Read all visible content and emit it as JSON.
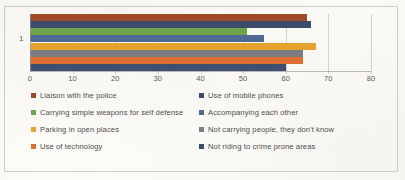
{
  "chart_data": {
    "type": "bar",
    "orientation": "horizontal",
    "title": "",
    "xlabel": "",
    "ylabel": "",
    "categories": [
      "1"
    ],
    "xlim": [
      0,
      80
    ],
    "xticks": [
      0,
      10,
      20,
      30,
      40,
      50,
      60,
      70,
      80
    ],
    "grid": true,
    "legend_position": "bottom",
    "series": [
      {
        "name": "Liaison with the police",
        "values": [
          65
        ],
        "color": "#9C4A28"
      },
      {
        "name": "Use of mobile phones",
        "values": [
          66
        ],
        "color": "#3C4B6B"
      },
      {
        "name": "Carrying simple weapons for self defense",
        "values": [
          51
        ],
        "color": "#6FA34A"
      },
      {
        "name": "Accompanying each other",
        "values": [
          55
        ],
        "color": "#4E6A92"
      },
      {
        "name": "Parking in open places",
        "values": [
          67
        ],
        "color": "#E5A22F"
      },
      {
        "name": "Not carrying people, they don't know",
        "values": [
          64
        ],
        "color": "#7A7D83"
      },
      {
        "name": "Use of technology",
        "values": [
          64
        ],
        "color": "#DE6F34"
      },
      {
        "name": "Not riding to  crime prone areas",
        "values": [
          60
        ],
        "color": "#3F4E73"
      }
    ]
  },
  "axis": {
    "tick_labels": [
      "0",
      "10",
      "20",
      "30",
      "40",
      "50",
      "60",
      "70",
      "80"
    ],
    "category_label": "1"
  },
  "legend": {
    "items": [
      {
        "label": "Liaison with the police",
        "color": "#9C4A28",
        "swatch": "legend-swatch"
      },
      {
        "label": "Use of mobile phones",
        "color": "#3C4B6B",
        "swatch": "legend-swatch"
      },
      {
        "label": "Carrying simple weapons for self defense",
        "color": "#6FA34A",
        "swatch": "legend-swatch"
      },
      {
        "label": "Accompanying each other",
        "color": "#4E6A92",
        "swatch": "legend-swatch"
      },
      {
        "label": "Parking in open places",
        "color": "#E5A22F",
        "swatch": "legend-swatch"
      },
      {
        "label": "Not carrying people, they don't know",
        "color": "#7A7D83",
        "swatch": "legend-swatch"
      },
      {
        "label": "Use of technology",
        "color": "#DE6F34",
        "swatch": "legend-swatch"
      },
      {
        "label": "Not riding to  crime prone areas",
        "color": "#3F4E73",
        "swatch": "legend-swatch"
      }
    ]
  }
}
